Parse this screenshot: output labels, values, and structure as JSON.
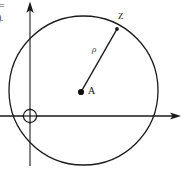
{
  "figure": {
    "kind": "geometry-diagram",
    "background_color": "#ffffff",
    "stroke_color": "#1a1a1a",
    "canvas": {
      "width": 189,
      "height": 170
    }
  },
  "axes": {
    "horizontal": {
      "label": "",
      "y": 116,
      "x_start": 0,
      "x_end": 181,
      "arrow": "right-arrowhead"
    },
    "vertical": {
      "label": "",
      "x": 30,
      "y_start": 2,
      "y_end": 166,
      "arrow": "up-arrowhead"
    }
  },
  "origin": {
    "marker": "crossed-circle",
    "x": 30,
    "y": 116,
    "radius": 7,
    "label": ""
  },
  "circle": {
    "center_x": 83.5,
    "center_y": 90.5,
    "radius": 74.5,
    "stroke_width": 1.3,
    "fill": "none"
  },
  "points": [
    {
      "id": "A",
      "label": "A",
      "x": 81,
      "y": 92,
      "marker": "filled-dot",
      "marker_radius": 3.1,
      "label_x": 88,
      "label_y": 87
    },
    {
      "id": "Z",
      "label": "Z",
      "x": 117,
      "y": 29,
      "marker": "none",
      "marker_radius": 0,
      "label_x": 118,
      "label_y": 13
    }
  ],
  "radius_segment": {
    "from": "A",
    "to": "Z",
    "label": "ρ",
    "label_x": 92,
    "label_y": 48,
    "stroke_width": 1.5
  },
  "margin_text": {
    "fragment_top": "=",
    "fragment_bottom": ")."
  }
}
